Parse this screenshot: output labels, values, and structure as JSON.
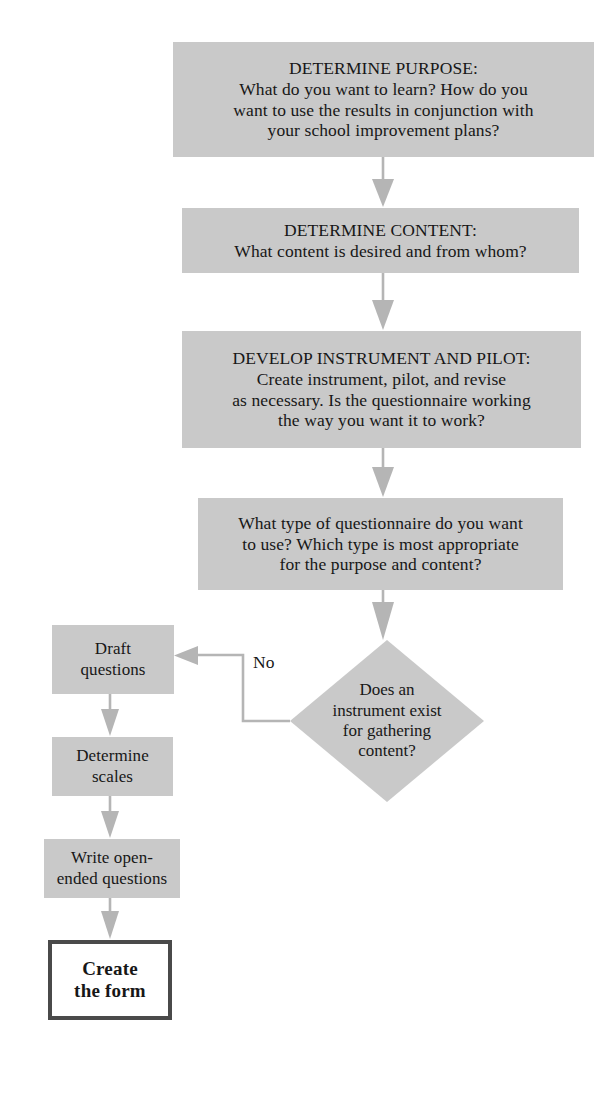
{
  "diagram": {
    "colors": {
      "node_fill": "#c9c9c9",
      "terminal_fill": "#ffffff",
      "terminal_border": "#4a4a4a",
      "connector": "#b5b5b5",
      "text": "#171717",
      "background": "#ffffff"
    },
    "nodes": [
      {
        "id": "determine-purpose",
        "shape": "process",
        "text": "DETERMINE PURPOSE:\nWhat do you want to learn? How do you\nwant to use the results in conjunction with\nyour school improvement plans?"
      },
      {
        "id": "determine-content",
        "shape": "process",
        "text": "DETERMINE CONTENT:\nWhat content is desired and from whom?"
      },
      {
        "id": "develop-instrument-and-pilot",
        "shape": "process",
        "text": "DEVELOP INSTRUMENT AND PILOT:\nCreate instrument, pilot, and revise\nas necessary. Is the questionnaire working\nthe way you want it to work?"
      },
      {
        "id": "questionnaire-type",
        "shape": "process",
        "text": "What type of questionnaire do you want\nto use? Which type is most appropriate\nfor the purpose and content?"
      },
      {
        "id": "instrument-exists-decision",
        "shape": "diamond",
        "text": "Does an\ninstrument exist\nfor gathering\ncontent?"
      },
      {
        "id": "draft-questions",
        "shape": "process",
        "text": "Draft\nquestions"
      },
      {
        "id": "determine-scales",
        "shape": "process",
        "text": "Determine\nscales"
      },
      {
        "id": "write-open-ended-questions",
        "shape": "process",
        "text": "Write open-\nended questions"
      },
      {
        "id": "create-the-form",
        "shape": "terminal",
        "text": "Create\nthe form"
      }
    ],
    "edges": [
      {
        "id": "purpose-to-content",
        "label": ""
      },
      {
        "id": "content-to-develop",
        "label": ""
      },
      {
        "id": "develop-to-type",
        "label": ""
      },
      {
        "id": "type-to-decision",
        "label": ""
      },
      {
        "id": "decision-no-to-draft",
        "label": "No"
      },
      {
        "id": "draft-to-scales",
        "label": ""
      },
      {
        "id": "scales-to-open-ended",
        "label": ""
      },
      {
        "id": "open-ended-to-create",
        "label": ""
      }
    ]
  }
}
